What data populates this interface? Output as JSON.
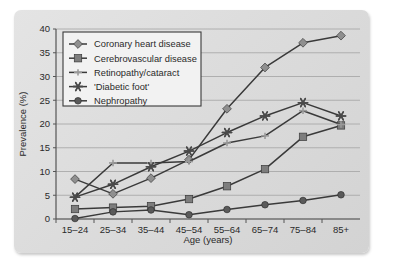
{
  "chart_data": {
    "type": "line",
    "title": "",
    "xlabel": "Age (years)",
    "ylabel": "Prevalence (%)",
    "categories": [
      "15–24",
      "25–34",
      "35–44",
      "45–54",
      "55–64",
      "65–74",
      "75–84",
      "85+"
    ],
    "ylim": [
      0,
      40
    ],
    "ytick_step": 5,
    "yticks": [
      "0",
      "5",
      "10",
      "15",
      "20",
      "25",
      "30",
      "35",
      "40"
    ],
    "grid": "horizontal",
    "legend_position": "top-left",
    "series": [
      {
        "name": "Coronary heart disease",
        "marker": "diamond",
        "color": "#8f8f8f",
        "line_color": "#3a3a3a",
        "values": [
          8.4,
          5.3,
          8.6,
          12.5,
          23.2,
          31.9,
          37.1,
          38.6
        ]
      },
      {
        "name": "Cerebrovascular disease",
        "marker": "square",
        "color": "#7d7d7d",
        "line_color": "#3a3a3a",
        "values": [
          2.1,
          2.4,
          2.7,
          4.2,
          6.9,
          10.5,
          17.3,
          19.7
        ]
      },
      {
        "name": "Retinopathy/cataract",
        "marker": "dash-plus",
        "color": "#9a9a9a",
        "line_color": "#3a3a3a",
        "values": [
          4.6,
          11.8,
          11.8,
          12.1,
          16.0,
          17.5,
          22.8,
          19.9
        ]
      },
      {
        "name": "'Diabetic foot'",
        "marker": "asterisk",
        "color": "#4a4a4a",
        "line_color": "#3a3a3a",
        "values": [
          4.6,
          7.3,
          11.0,
          14.3,
          18.2,
          21.7,
          24.5,
          21.7
        ]
      },
      {
        "name": "Nephropathy",
        "marker": "circle",
        "color": "#5a5a5a",
        "line_color": "#3a3a3a",
        "values": [
          0.1,
          1.5,
          1.9,
          0.9,
          2.0,
          3.0,
          3.9,
          5.1
        ]
      }
    ]
  }
}
